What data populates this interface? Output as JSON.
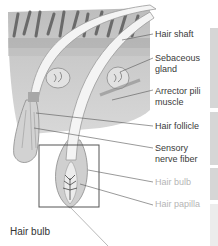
{
  "diagram": {
    "caption": "Hair bulb",
    "labels": [
      {
        "id": "hair-shaft",
        "text": "Hair shaft",
        "lines": [
          "Hair shaft"
        ],
        "faint": false
      },
      {
        "id": "sebaceous-gland",
        "text": "Sebaceous gland",
        "lines": [
          "Sebaceous",
          "gland"
        ],
        "faint": false
      },
      {
        "id": "arrector-pili-muscle",
        "text": "Arrector pili muscle",
        "lines": [
          "Arrector pili",
          "muscle"
        ],
        "faint": false
      },
      {
        "id": "hair-follicle",
        "text": "Hair follicle",
        "lines": [
          "Hair follicle"
        ],
        "faint": false
      },
      {
        "id": "sensory-nerve-fiber",
        "text": "Sensory nerve fiber",
        "lines": [
          "Sensory",
          "nerve fiber"
        ],
        "faint": false
      },
      {
        "id": "hair-bulb",
        "text": "Hair bulb",
        "lines": [
          "Hair bulb"
        ],
        "faint": true
      },
      {
        "id": "hair-papilla",
        "text": "Hair papilla",
        "lines": [
          "Hair papilla"
        ],
        "faint": true
      }
    ]
  },
  "colors": {
    "label_text": "#3a3a3a",
    "faint_label_text": "#b5b5b5",
    "skin_base": "#c8c8c8",
    "hair_shaft": "#f4f4f4",
    "leader_line": "#555555"
  }
}
